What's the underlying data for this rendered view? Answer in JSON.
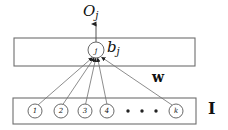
{
  "figure": {
    "background_color": "#ffffff",
    "stroke_color": "#666666",
    "text_color": "#111111",
    "width": 228,
    "height": 130
  },
  "labels": {
    "output": "O",
    "output_sub": "j",
    "bias": "b",
    "bias_sub": "j",
    "weights": "w",
    "input_layer": "I"
  },
  "neuron": {
    "label": "j",
    "cx": 96,
    "cy": 50,
    "r": 8
  },
  "output_arrow": {
    "x": 96,
    "y1": 42,
    "y2": 23
  },
  "layer_boxes": [
    {
      "name": "output-layer-box",
      "x": 14,
      "y": 38,
      "width": 181,
      "height": 28
    },
    {
      "name": "input-layer-box",
      "x": 13,
      "y": 98,
      "width": 183,
      "height": 26
    }
  ],
  "input_nodes": [
    {
      "label": "1",
      "cx": 35,
      "cy": 111,
      "r": 7
    },
    {
      "label": "2",
      "cx": 61,
      "cy": 111,
      "r": 7
    },
    {
      "label": "3",
      "cx": 85,
      "cy": 111,
      "r": 7
    },
    {
      "label": "4",
      "cx": 107,
      "cy": 111,
      "r": 7
    },
    {
      "label": "k",
      "cx": 176,
      "cy": 111,
      "r": 7
    }
  ],
  "ellipsis_dots": [
    {
      "cx": 128,
      "cy": 111,
      "r": 1.6
    },
    {
      "cx": 142,
      "cy": 111,
      "r": 1.6
    },
    {
      "cx": 156,
      "cy": 111,
      "r": 1.6
    }
  ],
  "connections": [
    {
      "from": "1",
      "x1": 38,
      "y1": 105,
      "x2": 92,
      "y2": 58
    },
    {
      "from": "2",
      "x1": 63,
      "y1": 105,
      "x2": 94,
      "y2": 58
    },
    {
      "from": "3",
      "x1": 86,
      "y1": 105,
      "x2": 96,
      "y2": 58
    },
    {
      "from": "4",
      "x1": 107,
      "y1": 105,
      "x2": 98,
      "y2": 58
    },
    {
      "from": "k",
      "x1": 173,
      "y1": 105,
      "x2": 101,
      "y2": 57
    }
  ]
}
